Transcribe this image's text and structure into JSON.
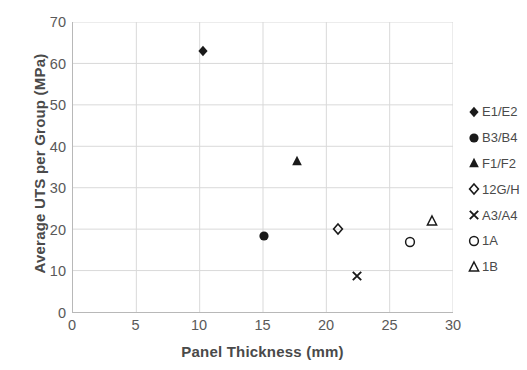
{
  "chart_data": {
    "type": "scatter",
    "title": "",
    "xlabel": "Panel Thickness (mm)",
    "ylabel": "Average UTS per Group (MPa)",
    "xlim": [
      0,
      30
    ],
    "ylim": [
      0,
      70
    ],
    "xticks": [
      0,
      5,
      10,
      15,
      20,
      25,
      30
    ],
    "yticks": [
      0,
      10,
      20,
      30,
      40,
      50,
      60,
      70
    ],
    "grid": true,
    "legend_position": "right",
    "marker_color": "#1a1a1a",
    "grid_color": "#d9d9d9",
    "axis_color": "#b8b8b8",
    "series": [
      {
        "name": "E1/E2",
        "marker": "filled-diamond",
        "x": [
          10.2
        ],
        "y": [
          63.0
        ]
      },
      {
        "name": "B3/B4",
        "marker": "filled-circle",
        "x": [
          15.0
        ],
        "y": [
          18.5
        ]
      },
      {
        "name": "F1/F2",
        "marker": "filled-triangle",
        "x": [
          17.6
        ],
        "y": [
          36.5
        ]
      },
      {
        "name": "12G/H",
        "marker": "open-diamond",
        "x": [
          20.9
        ],
        "y": [
          20.2
        ]
      },
      {
        "name": "A3/A4",
        "marker": "cross-x",
        "x": [
          22.4
        ],
        "y": [
          9.0
        ]
      },
      {
        "name": "1A",
        "marker": "open-circle",
        "x": [
          26.5
        ],
        "y": [
          17.0
        ]
      },
      {
        "name": "1B",
        "marker": "open-triangle",
        "x": [
          28.3
        ],
        "y": [
          22.2
        ]
      }
    ]
  },
  "axis": {
    "x_title": "Panel Thickness (mm)",
    "y_title": "Average UTS per Group (MPa)",
    "x_tick_labels": [
      "0",
      "5",
      "10",
      "15",
      "20",
      "25",
      "30"
    ],
    "y_tick_labels": [
      "70",
      "60",
      "50",
      "40",
      "30",
      "20",
      "10",
      "0"
    ]
  },
  "legend": {
    "items": [
      {
        "label": "E1/E2",
        "marker": "filled-diamond"
      },
      {
        "label": "B3/B4",
        "marker": "filled-circle"
      },
      {
        "label": "F1/F2",
        "marker": "filled-triangle"
      },
      {
        "label": "12G/H",
        "marker": "open-diamond"
      },
      {
        "label": "A3/A4",
        "marker": "cross-x"
      },
      {
        "label": "1A",
        "marker": "open-circle"
      },
      {
        "label": "1B",
        "marker": "open-triangle"
      }
    ]
  }
}
